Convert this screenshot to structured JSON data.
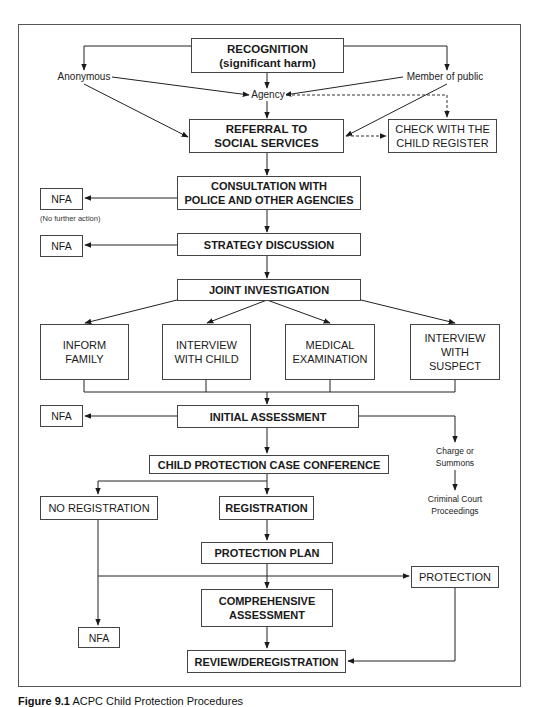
{
  "diagram": {
    "type": "flowchart",
    "title": "ACPC Child Protection Procedures",
    "nodes": {
      "recognition": "RECOGNITION\n(significant harm)",
      "anonymous": "Anonymous",
      "member_of_public": "Member of public",
      "agency": "Agency",
      "referral": "REFERRAL TO\nSOCIAL SERVICES",
      "check_register": "CHECK WITH THE\nCHILD REGISTER",
      "nfa_1": "NFA",
      "nfa_1_note": "(No further action)",
      "consultation": "CONSULTATION WITH\nPOLICE AND OTHER AGENCIES",
      "nfa_2": "NFA",
      "strategy": "STRATEGY DISCUSSION",
      "joint_investigation": "JOINT INVESTIGATION",
      "inform_family": "INFORM\nFAMILY",
      "interview_child": "INTERVIEW\nWITH CHILD",
      "medical": "MEDICAL\nEXAMINATION",
      "interview_suspect": "INTERVIEW\nWITH\nSUSPECT",
      "nfa_3": "NFA",
      "initial_assessment": "INITIAL ASSESSMENT",
      "charge_summons": "Charge or\nSummons",
      "criminal_court": "Criminal Court\nProceedings",
      "case_conference": "CHILD PROTECTION CASE CONFERENCE",
      "no_registration": "NO REGISTRATION",
      "registration": "REGISTRATION",
      "protection_plan": "PROTECTION PLAN",
      "protection": "PROTECTION",
      "comprehensive": "COMPREHENSIVE\nASSESSMENT",
      "nfa_4": "NFA",
      "review": "REVIEW/DEREGISTRATION"
    },
    "edges": [
      [
        "recognition",
        "anonymous"
      ],
      [
        "recognition",
        "member_of_public"
      ],
      [
        "recognition",
        "agency"
      ],
      [
        "anonymous",
        "agency"
      ],
      [
        "member_of_public",
        "agency"
      ],
      [
        "anonymous",
        "referral"
      ],
      [
        "member_of_public",
        "referral"
      ],
      [
        "agency",
        "referral"
      ],
      [
        "agency",
        "check_register",
        "dashed"
      ],
      [
        "referral",
        "check_register",
        "dashed"
      ],
      [
        "referral",
        "consultation"
      ],
      [
        "consultation",
        "nfa_1"
      ],
      [
        "consultation",
        "strategy"
      ],
      [
        "strategy",
        "nfa_2"
      ],
      [
        "strategy",
        "joint_investigation"
      ],
      [
        "joint_investigation",
        "inform_family"
      ],
      [
        "joint_investigation",
        "interview_child"
      ],
      [
        "joint_investigation",
        "medical"
      ],
      [
        "joint_investigation",
        "interview_suspect"
      ],
      [
        "inform_family",
        "initial_assessment"
      ],
      [
        "interview_child",
        "initial_assessment"
      ],
      [
        "medical",
        "initial_assessment"
      ],
      [
        "interview_suspect",
        "initial_assessment"
      ],
      [
        "initial_assessment",
        "nfa_3"
      ],
      [
        "initial_assessment",
        "case_conference"
      ],
      [
        "initial_assessment",
        "charge_summons"
      ],
      [
        "charge_summons",
        "criminal_court"
      ],
      [
        "case_conference",
        "no_registration"
      ],
      [
        "case_conference",
        "registration"
      ],
      [
        "registration",
        "protection_plan"
      ],
      [
        "protection_plan",
        "comprehensive"
      ],
      [
        "protection_plan",
        "protection"
      ],
      [
        "no_registration",
        "nfa_4"
      ],
      [
        "comprehensive",
        "review"
      ],
      [
        "protection",
        "review"
      ]
    ]
  },
  "caption": {
    "figure_label": "Figure 9.1",
    "text": "ACPC Child Protection Procedures"
  }
}
